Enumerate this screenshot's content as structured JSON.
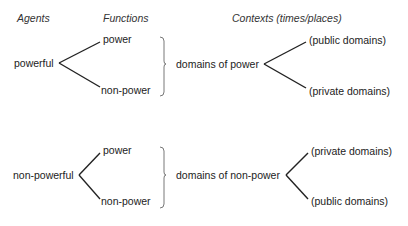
{
  "headers": {
    "agents": "Agents",
    "functions": "Functions",
    "contexts": "Contexts (times/places)"
  },
  "groups": [
    {
      "agent": "powerful",
      "functions": [
        "power",
        "non-power"
      ],
      "domain": "domains of power",
      "contexts": [
        "(public domains)",
        "(private domains)"
      ]
    },
    {
      "agent": "non-powerful",
      "functions": [
        "power",
        "non-power"
      ],
      "domain": "domains of non-power",
      "contexts": [
        "(private domains)",
        "(public domains)"
      ]
    }
  ],
  "colors": {
    "line": "#222222",
    "bracket": "#555555",
    "text": "#222222"
  }
}
